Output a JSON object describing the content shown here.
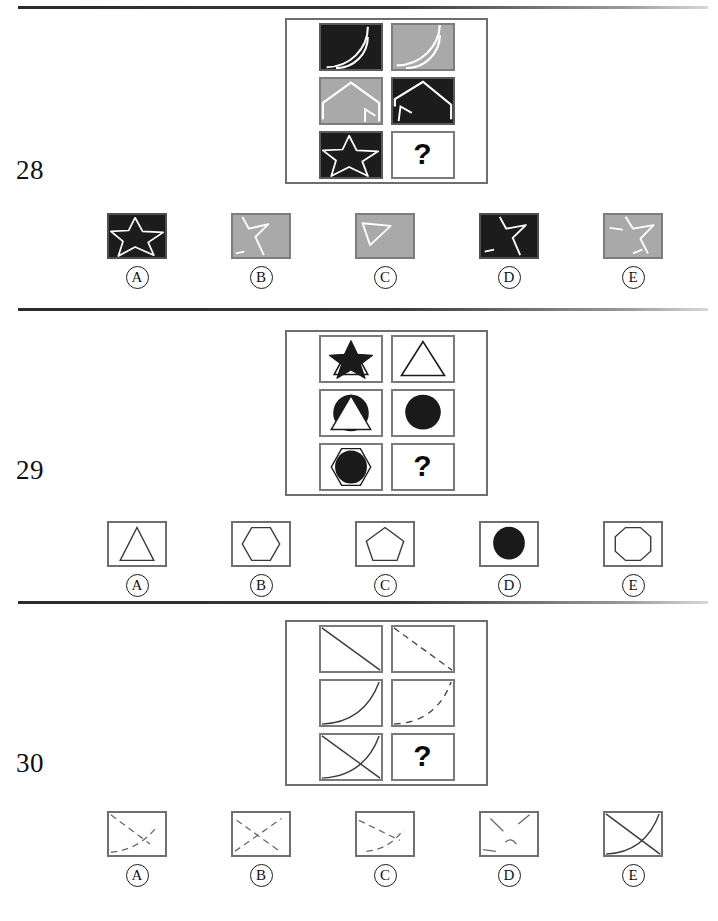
{
  "page": {
    "type": "matrix-reasoning-test",
    "width": 718,
    "height": 921,
    "background": "#ffffff",
    "rule_color": "#2b2b2b"
  },
  "colors": {
    "dark": "#1c1c1c",
    "gray": "#a9a9a9",
    "white": "#ffffff",
    "line": "#6f6f6f",
    "ink": "#101010"
  },
  "questions": [
    {
      "number": "28",
      "matrix": {
        "question_mark": "?",
        "cells": [
          {
            "position": "r1c1",
            "fill": "dark",
            "figure": "double-arc",
            "stroke": "#ffffff"
          },
          {
            "position": "r1c2",
            "fill": "gray",
            "figure": "double-arc",
            "stroke": "#ffffff"
          },
          {
            "position": "r2c1",
            "fill": "gray",
            "figure": "pentagon-house",
            "stroke": "#ffffff"
          },
          {
            "position": "r2c2",
            "fill": "dark",
            "figure": "pentagon-house",
            "stroke": "#ffffff"
          },
          {
            "position": "r3c1",
            "fill": "dark",
            "figure": "star-outline",
            "stroke": "#ffffff"
          },
          {
            "position": "r3c2",
            "fill": "white",
            "figure": "question-mark",
            "stroke": "#0a0a0a"
          }
        ]
      },
      "options": [
        {
          "letter": "A",
          "fill": "dark",
          "figure": "star-outline",
          "stroke": "#ffffff"
        },
        {
          "letter": "B",
          "fill": "gray",
          "figure": "star-partial",
          "stroke": "#ffffff"
        },
        {
          "letter": "C",
          "fill": "gray",
          "figure": "triangle-open",
          "stroke": "#ffffff"
        },
        {
          "letter": "D",
          "fill": "dark",
          "figure": "star-partial",
          "stroke": "#ffffff"
        },
        {
          "letter": "E",
          "fill": "gray",
          "figure": "star-outline",
          "stroke": "#ffffff"
        }
      ]
    },
    {
      "number": "29",
      "matrix": {
        "question_mark": "?",
        "cells": [
          {
            "position": "r1c1",
            "fill": "white",
            "figure": "triangle-with-filled-star",
            "stroke": "#1a1a1a"
          },
          {
            "position": "r1c2",
            "fill": "white",
            "figure": "triangle-open",
            "stroke": "#1a1a1a"
          },
          {
            "position": "r2c1",
            "fill": "white",
            "figure": "circle-with-triangle",
            "stroke": "#1a1a1a"
          },
          {
            "position": "r2c2",
            "fill": "white",
            "figure": "circle-filled",
            "stroke": "#1a1a1a"
          },
          {
            "position": "r3c1",
            "fill": "white",
            "figure": "hexagon-with-filled-circle",
            "stroke": "#1a1a1a"
          },
          {
            "position": "r3c2",
            "fill": "white",
            "figure": "question-mark",
            "stroke": "#0a0a0a"
          }
        ]
      },
      "options": [
        {
          "letter": "A",
          "fill": "plain",
          "figure": "triangle-open",
          "stroke": "#3a3a3a"
        },
        {
          "letter": "B",
          "fill": "plain",
          "figure": "hexagon-open",
          "stroke": "#3a3a3a"
        },
        {
          "letter": "C",
          "fill": "plain",
          "figure": "pentagon-open",
          "stroke": "#3a3a3a"
        },
        {
          "letter": "D",
          "fill": "plain",
          "figure": "circle-filled",
          "stroke": "#1a1a1a"
        },
        {
          "letter": "E",
          "fill": "plain",
          "figure": "octagon-open",
          "stroke": "#3a3a3a"
        }
      ]
    },
    {
      "number": "30",
      "matrix": {
        "question_mark": "?",
        "cells": [
          {
            "position": "r1c1",
            "fill": "white",
            "figure": "diagonal-solid",
            "stroke": "#3a3a3a"
          },
          {
            "position": "r1c2",
            "fill": "white",
            "figure": "diagonal-dashed",
            "stroke": "#3a3a3a"
          },
          {
            "position": "r2c1",
            "fill": "white",
            "figure": "curve-solid",
            "stroke": "#3a3a3a"
          },
          {
            "position": "r2c2",
            "fill": "white",
            "figure": "curve-dashed",
            "stroke": "#3a3a3a"
          },
          {
            "position": "r3c1",
            "fill": "white",
            "figure": "diagonal-and-curve-solid",
            "stroke": "#3a3a3a"
          },
          {
            "position": "r3c2",
            "fill": "white",
            "figure": "question-mark",
            "stroke": "#0a0a0a"
          }
        ]
      },
      "options": [
        {
          "letter": "A",
          "fill": "plain",
          "figure": "diagonal-and-curve-dashed-a",
          "stroke": "#6a6a6a"
        },
        {
          "letter": "B",
          "fill": "plain",
          "figure": "diagonal-and-curve-dashed-b",
          "stroke": "#6a6a6a"
        },
        {
          "letter": "C",
          "fill": "plain",
          "figure": "diagonal-and-curve-dashed-c",
          "stroke": "#6a6a6a"
        },
        {
          "letter": "D",
          "fill": "plain",
          "figure": "diagonal-and-curve-dashed-d",
          "stroke": "#6a6a6a"
        },
        {
          "letter": "E",
          "fill": "plain",
          "figure": "diagonal-and-curve-solid",
          "stroke": "#3a3a3a"
        }
      ]
    }
  ]
}
